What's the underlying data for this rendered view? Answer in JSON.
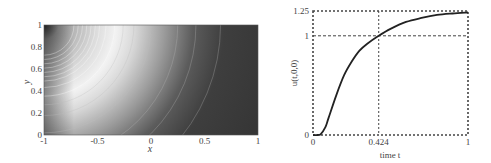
{
  "chart_data": [
    {
      "type": "heatmap",
      "title": "",
      "xlabel": "x",
      "ylabel": "y",
      "xlim": [
        -1,
        1
      ],
      "ylim": [
        0,
        1
      ],
      "xticks": [
        "-1",
        "-0.5",
        "0",
        "0.5",
        "1"
      ],
      "yticks": [
        "0",
        "0.2",
        "0.4",
        "0.6",
        "0.8",
        "1"
      ],
      "grid": false,
      "colormap": "grayscale",
      "description": "Grayscale field with circular contour lines centered at (-1, 1); brightest band near x≈-0.7 at y=0, fading to dark toward the right",
      "contour_center": [
        -1,
        1
      ],
      "contour_radii": [
        0.28,
        0.32,
        0.36,
        0.4,
        0.44,
        0.48,
        0.52,
        0.58,
        0.66,
        0.74,
        0.84,
        1.0,
        1.25,
        1.42,
        1.65
      ]
    },
    {
      "type": "line",
      "title": "",
      "xlabel": "time t",
      "ylabel": "u(t,0,0)",
      "xlim": [
        0,
        1
      ],
      "ylim": [
        0,
        1.25
      ],
      "xticks": [
        "0",
        "0.424",
        "1"
      ],
      "yticks": [
        "0",
        "1",
        "1.25"
      ],
      "grid": false,
      "reference_lines": [
        {
          "orientation": "vertical",
          "value": 0.424,
          "style": "dashed"
        },
        {
          "orientation": "horizontal",
          "value": 1,
          "style": "dashed"
        },
        {
          "orientation": "horizontal",
          "value": 1.25,
          "style": "dashed"
        }
      ],
      "series": [
        {
          "name": "u(t,0,0)",
          "x": [
            0,
            0.03,
            0.05,
            0.08,
            0.1,
            0.15,
            0.2,
            0.25,
            0.3,
            0.35,
            0.424,
            0.5,
            0.6,
            0.7,
            0.8,
            0.9,
            1.0
          ],
          "y": [
            0,
            0,
            0.01,
            0.08,
            0.17,
            0.4,
            0.6,
            0.74,
            0.85,
            0.92,
            1.0,
            1.07,
            1.14,
            1.18,
            1.21,
            1.225,
            1.235
          ]
        }
      ]
    }
  ],
  "left": {
    "xticks": [
      {
        "label": "-1",
        "v": -1
      },
      {
        "label": "-0.5",
        "v": -0.5
      },
      {
        "label": "0",
        "v": 0
      },
      {
        "label": "0.5",
        "v": 0.5
      },
      {
        "label": "1",
        "v": 1
      }
    ],
    "yticks": [
      {
        "label": "0",
        "v": 0
      },
      {
        "label": "0.2",
        "v": 0.2
      },
      {
        "label": "0.4",
        "v": 0.4
      },
      {
        "label": "0.6",
        "v": 0.6
      },
      {
        "label": "0.8",
        "v": 0.8
      },
      {
        "label": "1",
        "v": 1
      }
    ],
    "xlabel": "x",
    "ylabel": "y"
  },
  "right": {
    "xticks": [
      {
        "label": "0",
        "v": 0
      },
      {
        "label": "0.424",
        "v": 0.424
      },
      {
        "label": "1",
        "v": 1
      }
    ],
    "yticks": [
      {
        "label": "0",
        "v": 0
      },
      {
        "label": "1",
        "v": 1
      },
      {
        "label": "1.25",
        "v": 1.25
      }
    ],
    "xlabel": "time t",
    "ylabel": "u(t,0,0)"
  }
}
